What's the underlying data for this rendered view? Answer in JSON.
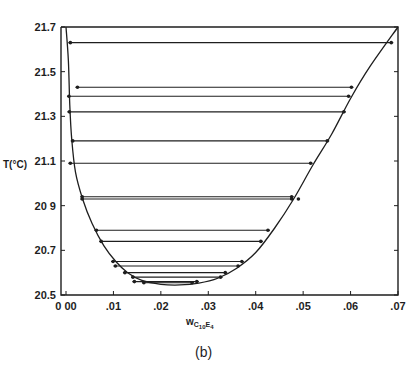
{
  "chart_data": {
    "type": "line",
    "subtype": "phase-diagram-coexistence-curve-with-tie-lines",
    "title": "",
    "caption": "(b)",
    "xlabel": "w",
    "xlabel_subscript": "C10E4",
    "ylabel": "T(°C)",
    "xlim": [
      0.0,
      0.07
    ],
    "ylim": [
      20.5,
      21.7
    ],
    "x_ticks": [
      0.0,
      0.01,
      0.02,
      0.03,
      0.04,
      0.05,
      0.06,
      0.07
    ],
    "x_tick_labels": [
      "0 00",
      ".01",
      ".02",
      ".03",
      ".04",
      ".05",
      ".06",
      ".07"
    ],
    "y_ticks": [
      20.5,
      20.7,
      20.9,
      21.1,
      21.3,
      21.5,
      21.7
    ],
    "y_tick_labels": [
      "20.5",
      "20.7",
      "20 9",
      "21.1",
      "21.3",
      "21.5",
      "21.7"
    ],
    "grid": false,
    "legend": null,
    "series": [
      {
        "name": "coexistence curve",
        "kind": "curve",
        "points": [
          [
            0.0,
            21.7
          ],
          [
            0.0005,
            21.55
          ],
          [
            0.0008,
            21.35
          ],
          [
            0.0012,
            21.2
          ],
          [
            0.002,
            21.05
          ],
          [
            0.0035,
            20.93
          ],
          [
            0.0055,
            20.82
          ],
          [
            0.008,
            20.72
          ],
          [
            0.0105,
            20.65
          ],
          [
            0.013,
            20.6
          ],
          [
            0.016,
            20.565
          ],
          [
            0.02,
            20.548
          ],
          [
            0.024,
            20.545
          ],
          [
            0.028,
            20.553
          ],
          [
            0.032,
            20.575
          ],
          [
            0.036,
            20.62
          ],
          [
            0.04,
            20.69
          ],
          [
            0.044,
            20.8
          ],
          [
            0.048,
            20.93
          ],
          [
            0.052,
            21.08
          ],
          [
            0.056,
            21.22
          ],
          [
            0.06,
            21.38
          ],
          [
            0.064,
            21.52
          ],
          [
            0.07,
            21.7
          ]
        ]
      },
      {
        "name": "tie-lines",
        "kind": "tie-lines",
        "lines": [
          {
            "T": 21.63,
            "w_left": 0.0005,
            "w_right": 0.069
          },
          {
            "T": 21.43,
            "w_left": 0.002,
            "w_right": 0.0606
          },
          {
            "T": 21.39,
            "w_left": 0.0002,
            "w_right": 0.06
          },
          {
            "T": 21.32,
            "w_left": 0.0003,
            "w_right": 0.059
          },
          {
            "T": 21.19,
            "w_left": 0.001,
            "w_right": 0.0555
          },
          {
            "T": 21.09,
            "w_left": 0.0005,
            "w_right": 0.052
          },
          {
            "T": 20.94,
            "w_left": 0.003,
            "w_right": 0.048
          },
          {
            "T": 20.93,
            "w_left": 0.003,
            "w_right": 0.048
          },
          {
            "T": 20.79,
            "w_left": 0.006,
            "w_right": 0.043
          },
          {
            "T": 20.74,
            "w_left": 0.007,
            "w_right": 0.0415
          },
          {
            "T": 20.65,
            "w_left": 0.0095,
            "w_right": 0.0375
          },
          {
            "T": 20.63,
            "w_left": 0.01,
            "w_right": 0.0367
          },
          {
            "T": 20.6,
            "w_left": 0.012,
            "w_right": 0.034
          },
          {
            "T": 20.58,
            "w_left": 0.0137,
            "w_right": 0.033
          },
          {
            "T": 20.56,
            "w_left": 0.014,
            "w_right": 0.028
          },
          {
            "T": 20.555,
            "w_left": 0.016,
            "w_right": 0.027
          }
        ]
      },
      {
        "name": "isolated point",
        "kind": "scatter",
        "points": [
          [
            0.049,
            20.93
          ]
        ]
      }
    ]
  },
  "labels": {
    "ylabel": "T(°C)",
    "xlabel_main": "w",
    "xlabel_sub1": "C",
    "xlabel_sub2": "10",
    "xlabel_sub3": "E",
    "xlabel_sub4": "4",
    "caption": "(b)"
  },
  "colors": {
    "ink": "#1e1e1e",
    "background": "#ffffff"
  }
}
